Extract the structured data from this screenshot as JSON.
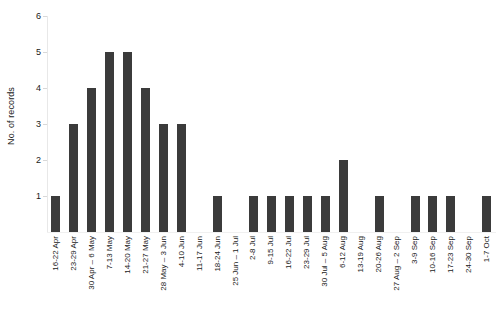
{
  "chart_data": {
    "type": "bar",
    "title": "",
    "subtitle": "",
    "xlabel": "",
    "ylabel": "No. of records",
    "ylim": [
      0,
      6
    ],
    "yticks": [
      0,
      1,
      2,
      3,
      4,
      5,
      6
    ],
    "ytick_labels": [
      "",
      "1",
      "2",
      "3",
      "4",
      "5",
      "6"
    ],
    "grid": false,
    "legend": null,
    "bar_color": "#3b3b3b",
    "categories": [
      "16-22 Apr",
      "23-29 Apr",
      "30 Apr – 6 May",
      "7-13 May",
      "14-20 May",
      "21-27 May",
      "28 May – 3 Jun",
      "4-10 Jun",
      "11-17 Jun",
      "18-24 Jun",
      "25 Jun – 1 Jul",
      "2-8 Jul",
      "9-15 Jul",
      "16-22 Jul",
      "23-29 Jul",
      "30 Jul – 5 Aug",
      "6-12 Aug",
      "13-19 Aug",
      "20-26 Aug",
      "27 Aug – 2 Sep",
      "3-9 Sep",
      "10-16 Sep",
      "17-23 Sep",
      "24-30 Sep",
      "1-7 Oct"
    ],
    "values": [
      1,
      3,
      4,
      5,
      5,
      4,
      3,
      3,
      0,
      1,
      0,
      1,
      1,
      1,
      1,
      1,
      2,
      0,
      1,
      0,
      1,
      1,
      1,
      0,
      1
    ]
  }
}
